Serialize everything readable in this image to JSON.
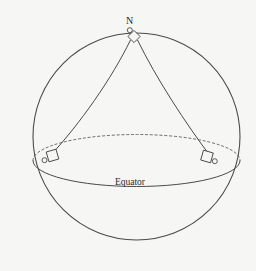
{
  "figure": {
    "type": "diagram",
    "background_color": "#f6f6f5",
    "ink_color": "#4a4a4a",
    "text_color": "#2a2a2a",
    "cropped_caption": "",
    "labels": {
      "north_pole": "N",
      "equator": "Equator"
    },
    "sphere": {
      "center_x": 136.5,
      "center_y": 136.5,
      "radius": 103.5,
      "stroke_width": 1.1
    },
    "equator_ellipse": {
      "center_x": 136.5,
      "center_y": 160.5,
      "radius_x": 103.5,
      "radius_y": 26,
      "front_visible": true,
      "back_dashed": true,
      "dash_pattern": "2.2 2.6"
    },
    "vertices": [
      {
        "name": "north-pole-vertex",
        "x": 129.5,
        "y": 30.5,
        "marker": "right-angle-diamond",
        "dot": true
      },
      {
        "name": "equator-vertex-left",
        "x": 44.5,
        "y": 160.0,
        "marker": "right-angle-square",
        "dot": true
      },
      {
        "name": "equator-vertex-right",
        "x": 214.5,
        "y": 161.0,
        "marker": "right-angle-square",
        "dot": true
      }
    ],
    "meridians": [
      {
        "name": "meridian-left",
        "from": "north-pole-vertex",
        "to": "equator-vertex-left"
      },
      {
        "name": "meridian-right",
        "from": "north-pole-vertex",
        "to": "equator-vertex-right"
      }
    ],
    "equator_label_position": {
      "x": 130,
      "y": 185
    },
    "north_label_position": {
      "x": 129.5,
      "y": 24
    }
  }
}
